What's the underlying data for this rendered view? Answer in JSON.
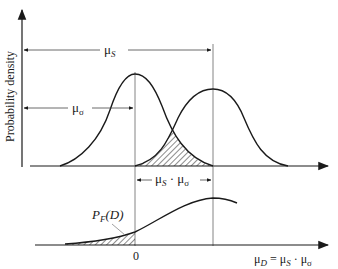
{
  "diagram": {
    "y_axis_label": "Probability density",
    "upper_labels": {
      "mu_s": {
        "main": "μ",
        "sub": "S"
      },
      "mu_sigma": {
        "main": "μ",
        "sub": "σ"
      },
      "difference": {
        "main1": "μ",
        "sub1": "S",
        "sep": " · ",
        "main2": "μ",
        "sub2": "σ"
      }
    },
    "lower_labels": {
      "pf": {
        "main": "P",
        "sub": "F",
        "arg": "(D)"
      },
      "zero": "0",
      "x_axis": {
        "main": "μ",
        "sub": "D",
        "eq": " = ",
        "main1": "μ",
        "sub1": "S",
        "sep": " · ",
        "main2": "μ",
        "sub2": "σ"
      }
    },
    "colors": {
      "line": "#1a1a1a",
      "guide": "#555555"
    }
  }
}
